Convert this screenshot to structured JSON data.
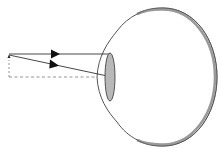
{
  "diagram": {
    "title": "",
    "colors": {
      "background": "#ffffff",
      "outline": "#444444",
      "ray": "#333333",
      "axis": "#888888",
      "lens_fill": "#b8b8b8",
      "retina_band": "#9a9a9a"
    },
    "elements": [
      {
        "name": "object-arrow",
        "type": "arrow",
        "from": [
          9,
          78
        ],
        "to": [
          9,
          55
        ]
      },
      {
        "name": "ray-parallel",
        "type": "ray",
        "from": [
          9,
          54
        ],
        "to": [
          110,
          54
        ],
        "arrowhead_at": [
          59,
          54
        ]
      },
      {
        "name": "ray-through-center",
        "type": "ray",
        "from": [
          9,
          55
        ],
        "to": [
          112,
          77
        ],
        "arrowhead_at": [
          58,
          65
        ]
      },
      {
        "name": "optical-axis",
        "type": "dashed-line",
        "from": [
          9,
          77
        ],
        "to": [
          217,
          77
        ]
      },
      {
        "name": "object-baseline",
        "type": "dashed-line",
        "from": [
          9,
          78
        ],
        "to": [
          9,
          60
        ]
      },
      {
        "name": "eyeball",
        "type": "outline",
        "center": [
          153,
          77
        ],
        "rx": 64,
        "ry": 69
      },
      {
        "name": "cornea",
        "type": "bulge",
        "leftmost": [
          97,
          77
        ]
      },
      {
        "name": "lens",
        "type": "ellipse",
        "center": [
          110,
          77
        ],
        "rx": 5,
        "ry": 24
      },
      {
        "name": "retina",
        "type": "thick-band",
        "from": [
          136,
          14
        ],
        "to": [
          136,
          140
        ]
      }
    ]
  }
}
